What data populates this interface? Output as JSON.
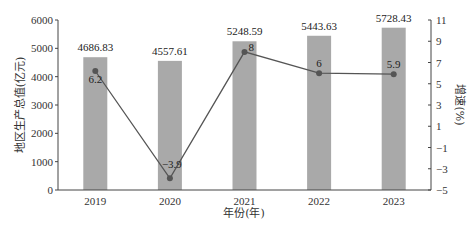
{
  "chart_data": {
    "type": "bar",
    "combo": "bar+line",
    "title": "",
    "categories": [
      "2019",
      "2020",
      "2021",
      "2022",
      "2023"
    ],
    "xlabel": "年份(年)",
    "series": [
      {
        "name": "地区生产总值(亿元)",
        "type": "bar",
        "axis": "left",
        "values": [
          4686.83,
          4557.61,
          5248.59,
          5443.63,
          5728.43
        ],
        "labels": [
          "4686.83",
          "4557.61",
          "5248.59",
          "5443.63",
          "5728.43"
        ],
        "color": "#a9a9a9"
      },
      {
        "name": "增速(%)",
        "type": "line",
        "axis": "right",
        "values": [
          6.2,
          -3.9,
          8,
          6,
          5.9
        ],
        "labels": [
          "6.2",
          "−3.9",
          "8",
          "6",
          "5.9"
        ],
        "color": "#555555"
      }
    ],
    "y_left": {
      "label": "地区生产总值(亿元)",
      "lim": [
        0,
        6000
      ],
      "ticks": [
        0,
        1000,
        2000,
        3000,
        4000,
        5000,
        6000
      ],
      "tick_labels": [
        "0",
        "1000",
        "2000",
        "3000",
        "4000",
        "5000",
        "6000"
      ]
    },
    "y_right": {
      "label": "增速(%)",
      "lim": [
        -5,
        11
      ],
      "ticks": [
        -5,
        -3,
        -1,
        1,
        3,
        5,
        7,
        9,
        11
      ],
      "tick_labels": [
        "−5",
        "−3",
        "−1",
        "1",
        "3",
        "5",
        "7",
        "9",
        "11"
      ]
    },
    "grid": false,
    "legend": "none"
  }
}
